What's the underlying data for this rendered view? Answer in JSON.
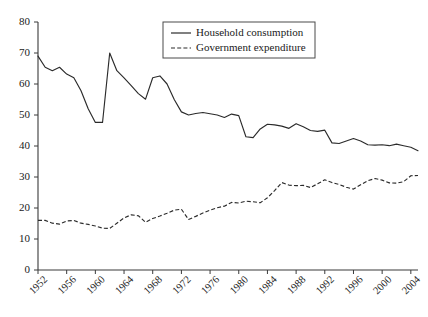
{
  "chart_data": {
    "type": "line",
    "title": "",
    "xlabel": "",
    "ylabel": "",
    "ylim": [
      0,
      80
    ],
    "xlim": [
      1952,
      2005
    ],
    "ytick_step": 10,
    "yticks": [
      0,
      10,
      20,
      30,
      40,
      50,
      60,
      70,
      80
    ],
    "xticks": [
      1952,
      1956,
      1960,
      1964,
      1968,
      1972,
      1976,
      1980,
      1984,
      1988,
      1992,
      1996,
      2000,
      2004
    ],
    "grid": false,
    "legend_position": "top-center",
    "x": [
      1952,
      1953,
      1954,
      1955,
      1956,
      1957,
      1958,
      1959,
      1960,
      1961,
      1962,
      1963,
      1964,
      1965,
      1966,
      1967,
      1968,
      1969,
      1970,
      1971,
      1972,
      1973,
      1974,
      1975,
      1976,
      1977,
      1978,
      1979,
      1980,
      1981,
      1982,
      1983,
      1984,
      1985,
      1986,
      1987,
      1988,
      1989,
      1990,
      1991,
      1992,
      1993,
      1994,
      1995,
      1996,
      1997,
      1998,
      1999,
      2000,
      2001,
      2002,
      2003,
      2004,
      2005
    ],
    "series": [
      {
        "name": "Household consumption",
        "style": "solid",
        "color": "#2b2b2b",
        "values": [
          69.0,
          65.4,
          64.3,
          65.4,
          63.2,
          62.0,
          57.8,
          52.0,
          47.6,
          47.6,
          70.0,
          64.3,
          62.0,
          59.5,
          56.9,
          55.1,
          62.0,
          62.6,
          60.0,
          55.0,
          51.0,
          50.0,
          50.5,
          50.8,
          50.4,
          50.0,
          49.2,
          50.3,
          49.8,
          43.0,
          42.7,
          45.5,
          47.0,
          46.8,
          46.4,
          45.7,
          47.2,
          46.2,
          45.0,
          44.7,
          45.1,
          41.0,
          40.8,
          41.6,
          42.4,
          41.6,
          40.4,
          40.3,
          40.4,
          40.1,
          40.6,
          40.1,
          39.6,
          38.5
        ]
      },
      {
        "name": "Government expenditure",
        "style": "dashed",
        "color": "#2b2b2b",
        "values": [
          16.0,
          16.0,
          15.1,
          14.8,
          15.8,
          16.0,
          15.1,
          14.7,
          14.2,
          13.5,
          13.4,
          15.1,
          16.8,
          17.8,
          17.5,
          15.4,
          16.6,
          17.4,
          18.3,
          19.3,
          19.6,
          16.3,
          17.3,
          18.4,
          19.3,
          20.1,
          20.6,
          21.8,
          21.6,
          22.2,
          22.0,
          21.7,
          23.3,
          25.6,
          28.2,
          27.4,
          27.2,
          27.3,
          26.6,
          27.8,
          29.1,
          28.2,
          27.6,
          26.7,
          26.1,
          27.5,
          28.8,
          29.5,
          29.0,
          28.1,
          28.0,
          28.5,
          30.4,
          30.5
        ]
      }
    ],
    "legend": [
      {
        "label": "Household consumption",
        "style": "solid"
      },
      {
        "label": "Government expenditure",
        "style": "dashed"
      }
    ]
  }
}
